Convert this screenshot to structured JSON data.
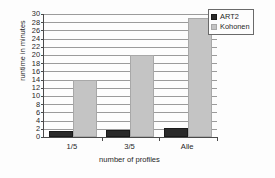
{
  "chart_data": {
    "type": "bar",
    "title": "",
    "subtitle": "",
    "xlabel": "number of profiles",
    "ylabel": "runtime in minutes",
    "categories": [
      "1/5",
      "3/5",
      "Alle"
    ],
    "series": [
      {
        "name": "ART2",
        "values": [
          1.4,
          1.8,
          2.3
        ],
        "color": "#2a2a2a"
      },
      {
        "name": "Kohonen",
        "values": [
          14,
          20,
          29
        ],
        "color": "#c4c4c4"
      }
    ],
    "ylim": [
      0,
      30
    ],
    "ytick_step": 2,
    "yticks": [
      30,
      28,
      26,
      24,
      22,
      20,
      18,
      16,
      14,
      12,
      10,
      8,
      6,
      4,
      2,
      0
    ],
    "grid": "horizontal",
    "legend_position": "top-right",
    "annotations": []
  },
  "legend": {
    "entries": [
      {
        "label": "ART2",
        "swatch": "art2"
      },
      {
        "label": "Kohonen",
        "swatch": "kohonen"
      }
    ]
  }
}
